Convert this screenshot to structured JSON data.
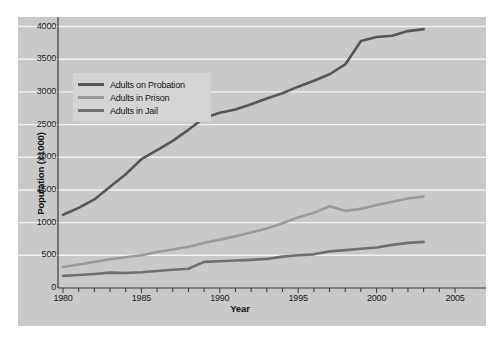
{
  "chart_data": {
    "type": "line",
    "title": "",
    "xlabel": "Year",
    "ylabel": "Population (x1000)",
    "xlim": [
      1980,
      2005
    ],
    "ylim": [
      0,
      4100
    ],
    "grid": true,
    "grid_axis": "y",
    "legend_position": "upper-left-inside",
    "x": [
      1980,
      1981,
      1982,
      1983,
      1984,
      1985,
      1986,
      1987,
      1988,
      1989,
      1990,
      1991,
      1992,
      1993,
      1994,
      1995,
      1996,
      1997,
      1998,
      1999,
      2000,
      2001,
      2002,
      2003
    ],
    "series": [
      {
        "name": "Adults on Probation",
        "color": "#575757",
        "values": [
          1120,
          1225,
          1355,
          1550,
          1740,
          1970,
          2110,
          2250,
          2420,
          2600,
          2680,
          2730,
          2810,
          2900,
          2980,
          3080,
          3170,
          3270,
          3420,
          3780,
          3840,
          3860,
          3930,
          3960
        ]
      },
      {
        "name": "Adults in Prison",
        "color": "#9a9a9a",
        "values": [
          320,
          360,
          400,
          440,
          470,
          500,
          550,
          590,
          630,
          690,
          740,
          790,
          850,
          910,
          990,
          1080,
          1150,
          1250,
          1180,
          1210,
          1270,
          1320,
          1370,
          1400
        ]
      },
      {
        "name": "Adults in Jail",
        "color": "#6f6f6f",
        "values": [
          185,
          200,
          215,
          235,
          230,
          240,
          260,
          280,
          295,
          400,
          410,
          420,
          430,
          445,
          480,
          500,
          515,
          560,
          580,
          600,
          620,
          660,
          690,
          705
        ]
      }
    ],
    "y_ticks": [
      0,
      500,
      1000,
      1500,
      2000,
      2500,
      3000,
      3500,
      4000
    ],
    "y_tick_labels": [
      "0",
      "500",
      "1000",
      "1500",
      "2000",
      "2500",
      "3000",
      "3500",
      "4000"
    ],
    "x_ticks": [
      1980,
      1985,
      1990,
      1995,
      2000,
      2005
    ],
    "x_tick_labels": [
      "1980",
      "1985",
      "1990",
      "1995",
      "2000",
      "2005"
    ],
    "x_minor_tick_step": 1,
    "plot_background": "#c9c9c9",
    "gridline_color": "#f2f2f2",
    "page_background": "#ffffff",
    "axis_color": "#3a3a3a"
  },
  "legend": {
    "items": [
      {
        "label": "Adults on Probation",
        "color": "#575757"
      },
      {
        "label": "Adults in Prison",
        "color": "#9a9a9a"
      },
      {
        "label": "Adults in Jail",
        "color": "#6f6f6f"
      }
    ]
  }
}
